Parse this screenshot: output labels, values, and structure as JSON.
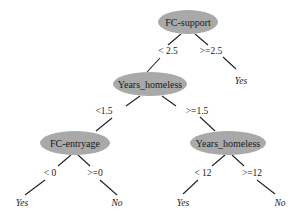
{
  "colors": {
    "node_fill": "#a9a9a9",
    "line": "#222222",
    "background": "#ffffff"
  },
  "tree": {
    "root": {
      "label": "FC-support",
      "left_edge": "< 2.5",
      "right_edge": ">=2.5"
    },
    "root_right_leaf": "Yes",
    "node2": {
      "label": "Years_homeless",
      "left_edge": "<1.5",
      "right_edge": ">=1.5"
    },
    "node3": {
      "label": "FC-entryage",
      "left_edge": "< 0",
      "right_edge": ">=0",
      "left_leaf": "Yes",
      "right_leaf": "No"
    },
    "node4": {
      "label": "Years_homeless",
      "left_edge": "< 12",
      "right_edge": ">=12",
      "left_leaf": "Yes",
      "right_leaf": "No"
    }
  }
}
